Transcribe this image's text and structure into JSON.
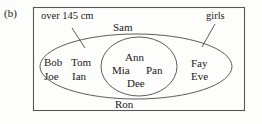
{
  "figure": {
    "part_label": "(b)",
    "type": "venn-diagram"
  },
  "sets": {
    "outer": {
      "label": "over 145 cm",
      "leader_line": true
    },
    "inner": {
      "label": "girls",
      "leader_line": true
    }
  },
  "regions": {
    "outer_only": {
      "names": [
        "Bob",
        "Joe",
        "Tom",
        "Ian"
      ]
    },
    "intersection": {
      "names": [
        "Ann",
        "Mia",
        "Pan",
        "Dee"
      ]
    },
    "inner_only": {
      "names": [
        "Fay",
        "Eve"
      ]
    },
    "boundary_top": {
      "name": "Sam"
    },
    "boundary_bottom": {
      "name": "Ron"
    }
  },
  "names": {
    "sam": "Sam",
    "ron": "Ron",
    "bob": "Bob",
    "joe": "Joe",
    "tom": "Tom",
    "ian": "Ian",
    "ann": "Ann",
    "mia": "Mia",
    "pan": "Pan",
    "dee": "Dee",
    "fay": "Fay",
    "eve": "Eve"
  },
  "colors": {
    "stroke": "#3c3c3c",
    "text": "#1a1a1a",
    "background": "#fdfdfc"
  }
}
